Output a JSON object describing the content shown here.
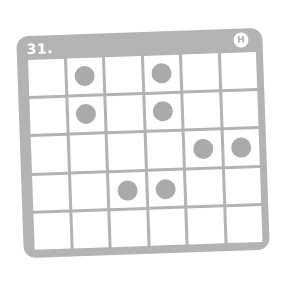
{
  "puzzle": {
    "number_label": "31.",
    "badge_label": "H",
    "rows": 5,
    "cols": 6,
    "colors": {
      "card": "#b3b3b3",
      "dot": "#aaaaaa",
      "cell": "#ffffff"
    },
    "dots": [
      [
        0,
        1,
        0,
        1,
        0,
        0
      ],
      [
        0,
        1,
        0,
        1,
        0,
        0
      ],
      [
        0,
        0,
        0,
        0,
        1,
        1
      ],
      [
        0,
        0,
        1,
        1,
        0,
        0
      ],
      [
        0,
        0,
        0,
        0,
        0,
        0
      ]
    ]
  }
}
